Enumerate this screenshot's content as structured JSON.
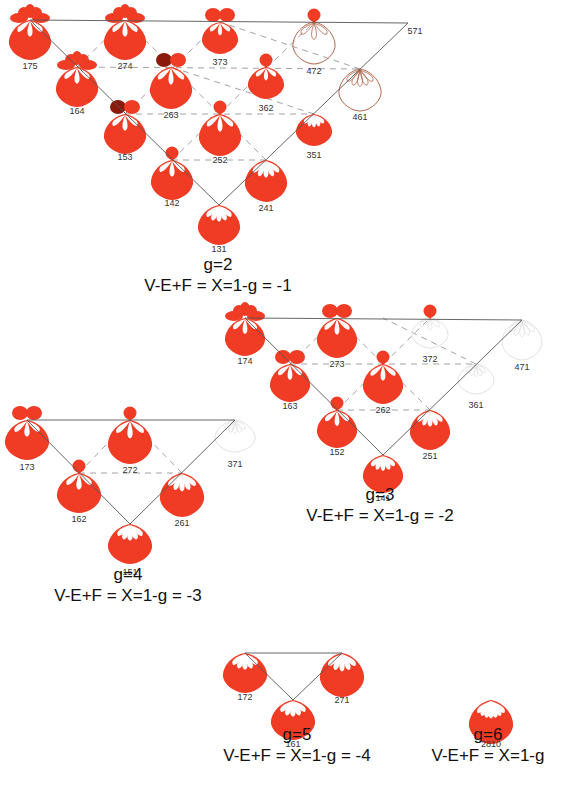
{
  "colors": {
    "fill": "#f03c24",
    "dark": "#8a1a0c",
    "outline": "#b0664a",
    "ghost": "#e2e2e2",
    "line": "#555555",
    "dash": "#8a8a8a"
  },
  "panels": [
    {
      "id": "g2",
      "caption_g": "g=2",
      "caption_formula": "V-E+F = X=1-g = -1",
      "caption_pos": [
        218,
        270
      ],
      "nodes": [
        {
          "label": "175",
          "x": 30,
          "y": 20,
          "style": "solid",
          "top": "four",
          "w": 42,
          "h": 40,
          "lx": 30,
          "ly": 69
        },
        {
          "label": "274",
          "x": 125,
          "y": 20,
          "style": "solid",
          "top": "four",
          "w": 42,
          "h": 40,
          "lx": 125,
          "ly": 69
        },
        {
          "label": "373",
          "x": 220,
          "y": 22,
          "style": "solid",
          "top": "two",
          "w": 36,
          "h": 32,
          "lx": 220,
          "ly": 65
        },
        {
          "label": "472",
          "x": 314,
          "y": 22,
          "style": "outline",
          "top": "one",
          "w": 42,
          "h": 42,
          "lx": 314,
          "ly": 74
        },
        {
          "label": "571",
          "x": 408,
          "y": 23,
          "style": "none",
          "top": "none",
          "w": 0,
          "h": 0,
          "lx": 415,
          "ly": 34
        },
        {
          "label": "164",
          "x": 77,
          "y": 67,
          "style": "solid",
          "top": "four",
          "w": 42,
          "h": 40,
          "lx": 77,
          "ly": 114
        },
        {
          "label": "263",
          "x": 171,
          "y": 67,
          "style": "solid",
          "top": "two",
          "w": 42,
          "h": 42,
          "lx": 171,
          "ly": 118
        },
        {
          "label": "362",
          "x": 266,
          "y": 67,
          "style": "solid",
          "top": "one",
          "w": 36,
          "h": 32,
          "lx": 266,
          "ly": 111
        },
        {
          "label": "461",
          "x": 360,
          "y": 69,
          "style": "outline",
          "top": "none",
          "w": 42,
          "h": 42,
          "lx": 360,
          "ly": 120
        },
        {
          "label": "153",
          "x": 125,
          "y": 114,
          "style": "solid",
          "top": "two",
          "w": 42,
          "h": 40,
          "lx": 125,
          "ly": 160
        },
        {
          "label": "252",
          "x": 220,
          "y": 114,
          "style": "solid",
          "top": "one",
          "w": 42,
          "h": 42,
          "lx": 220,
          "ly": 163
        },
        {
          "label": "351",
          "x": 314,
          "y": 114,
          "style": "solid",
          "top": "none",
          "w": 36,
          "h": 32,
          "lx": 314,
          "ly": 158
        },
        {
          "label": "142",
          "x": 172,
          "y": 160,
          "style": "solid",
          "top": "one",
          "w": 42,
          "h": 40,
          "lx": 172,
          "ly": 206
        },
        {
          "label": "241",
          "x": 266,
          "y": 160,
          "style": "solid",
          "top": "none",
          "w": 42,
          "h": 42,
          "lx": 266,
          "ly": 211
        },
        {
          "label": "131",
          "x": 219,
          "y": 205,
          "style": "solid",
          "top": "none",
          "w": 42,
          "h": 40,
          "lx": 219,
          "ly": 252
        }
      ],
      "solid_lines": [
        [
          30,
          20,
          408,
          23
        ],
        [
          30,
          20,
          219,
          205
        ],
        [
          219,
          205,
          408,
          23
        ]
      ],
      "dash_lines": [
        [
          77,
          67,
          360,
          69
        ],
        [
          125,
          114,
          314,
          114
        ],
        [
          172,
          160,
          266,
          160
        ],
        [
          77,
          67,
          125,
          20
        ],
        [
          125,
          114,
          220,
          22
        ],
        [
          172,
          160,
          314,
          22
        ],
        [
          266,
          160,
          125,
          20
        ],
        [
          314,
          114,
          171,
          67
        ],
        [
          360,
          69,
          220,
          22
        ]
      ]
    },
    {
      "id": "g3",
      "caption_g": "g=3",
      "caption_formula": "V-E+F = X=1-g = -2",
      "caption_pos": [
        380,
        500
      ],
      "nodes": [
        {
          "label": "174",
          "x": 245,
          "y": 318,
          "style": "solid",
          "top": "four",
          "w": 40,
          "h": 38,
          "lx": 245,
          "ly": 364
        },
        {
          "label": "273",
          "x": 337,
          "y": 318,
          "style": "solid",
          "top": "two",
          "w": 40,
          "h": 40,
          "lx": 337,
          "ly": 367
        },
        {
          "label": "372",
          "x": 430,
          "y": 318,
          "style": "ghost",
          "top": "one",
          "w": 36,
          "h": 30,
          "lx": 430,
          "ly": 362
        },
        {
          "label": "471",
          "x": 522,
          "y": 320,
          "style": "ghost",
          "top": "none",
          "w": 40,
          "h": 40,
          "lx": 522,
          "ly": 370
        },
        {
          "label": "163",
          "x": 290,
          "y": 364,
          "style": "solid",
          "top": "two",
          "w": 40,
          "h": 38,
          "lx": 290,
          "ly": 409
        },
        {
          "label": "262",
          "x": 383,
          "y": 364,
          "style": "solid",
          "top": "one",
          "w": 40,
          "h": 40,
          "lx": 383,
          "ly": 413
        },
        {
          "label": "361",
          "x": 476,
          "y": 364,
          "style": "ghost",
          "top": "none",
          "w": 36,
          "h": 30,
          "lx": 476,
          "ly": 408
        },
        {
          "label": "152",
          "x": 337,
          "y": 410,
          "style": "solid",
          "top": "one",
          "w": 40,
          "h": 38,
          "lx": 337,
          "ly": 455
        },
        {
          "label": "251",
          "x": 430,
          "y": 410,
          "style": "solid",
          "top": "none",
          "w": 40,
          "h": 40,
          "lx": 430,
          "ly": 459
        },
        {
          "label": "141",
          "x": 383,
          "y": 455,
          "style": "solid",
          "top": "none",
          "w": 40,
          "h": 38,
          "lx": 383,
          "ly": 501
        }
      ],
      "solid_lines": [
        [
          245,
          318,
          522,
          320
        ],
        [
          245,
          318,
          383,
          455
        ],
        [
          383,
          455,
          522,
          320
        ]
      ],
      "dash_lines": [
        [
          290,
          364,
          476,
          364
        ],
        [
          337,
          410,
          430,
          410
        ],
        [
          290,
          364,
          337,
          318
        ],
        [
          337,
          410,
          430,
          318
        ],
        [
          430,
          410,
          337,
          318
        ],
        [
          476,
          364,
          383,
          318
        ]
      ]
    },
    {
      "id": "g4",
      "caption_g": "g=4",
      "caption_formula": "V-E+F = X=1-g = -3",
      "caption_pos": [
        128,
        580
      ],
      "nodes": [
        {
          "label": "173",
          "x": 27,
          "y": 420,
          "style": "solid",
          "top": "two",
          "w": 44,
          "h": 40,
          "lx": 27,
          "ly": 470
        },
        {
          "label": "272",
          "x": 130,
          "y": 420,
          "style": "solid",
          "top": "one",
          "w": 44,
          "h": 44,
          "lx": 130,
          "ly": 473
        },
        {
          "label": "371",
          "x": 235,
          "y": 420,
          "style": "ghost",
          "top": "none",
          "w": 40,
          "h": 32,
          "lx": 235,
          "ly": 467
        },
        {
          "label": "162",
          "x": 79,
          "y": 473,
          "style": "solid",
          "top": "one",
          "w": 44,
          "h": 40,
          "lx": 79,
          "ly": 522
        },
        {
          "label": "261",
          "x": 182,
          "y": 473,
          "style": "solid",
          "top": "none",
          "w": 44,
          "h": 44,
          "lx": 182,
          "ly": 526
        },
        {
          "label": "151",
          "x": 130,
          "y": 524,
          "style": "solid",
          "top": "none",
          "w": 44,
          "h": 40,
          "lx": 130,
          "ly": 575
        }
      ],
      "solid_lines": [
        [
          27,
          420,
          235,
          420
        ],
        [
          27,
          420,
          130,
          524
        ],
        [
          130,
          524,
          235,
          420
        ]
      ],
      "dash_lines": [
        [
          79,
          473,
          182,
          473
        ],
        [
          79,
          473,
          130,
          420
        ],
        [
          182,
          473,
          130,
          420
        ]
      ]
    },
    {
      "id": "g5",
      "caption_g": "g=5",
      "caption_formula": "V-E+F = X=1-g = -4",
      "caption_pos": [
        297,
        740
      ],
      "nodes": [
        {
          "label": "172",
          "x": 245,
          "y": 653,
          "style": "solid",
          "top": "none",
          "w": 44,
          "h": 40,
          "lx": 245,
          "ly": 700
        },
        {
          "label": "271",
          "x": 342,
          "y": 653,
          "style": "solid",
          "top": "none",
          "w": 44,
          "h": 44,
          "lx": 342,
          "ly": 703
        },
        {
          "label": "161",
          "x": 293,
          "y": 700,
          "style": "solid",
          "top": "none",
          "w": 44,
          "h": 40,
          "lx": 293,
          "ly": 747
        }
      ],
      "solid_lines": [
        [
          245,
          653,
          342,
          653
        ],
        [
          245,
          653,
          293,
          700
        ],
        [
          293,
          700,
          342,
          653
        ]
      ],
      "dash_lines": []
    },
    {
      "id": "g6",
      "caption_g": "g=6",
      "caption_formula": "V-E+F = X=1-g",
      "caption_pos": [
        488,
        740
      ],
      "nodes": [
        {
          "label": "2810",
          "x": 491,
          "y": 700,
          "style": "solid",
          "top": "none",
          "w": 44,
          "h": 44,
          "lx": 491,
          "ly": 747
        }
      ],
      "solid_lines": [],
      "dash_lines": []
    }
  ]
}
